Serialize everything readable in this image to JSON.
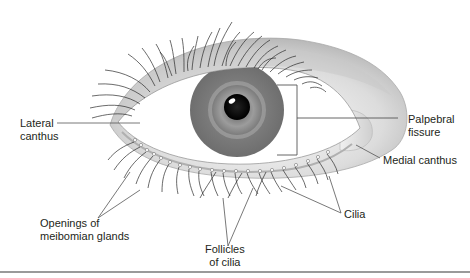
{
  "diagram": {
    "labels": {
      "lateral_canthus": [
        "Lateral",
        "canthus"
      ],
      "palpebral_fissure": [
        "Palpebral",
        "fissure"
      ],
      "medial_canthus": [
        "Medial canthus"
      ],
      "openings_meibomian": [
        "Openings of",
        "meibomian glands"
      ],
      "follicles_cilia": [
        "Follicles",
        "of cilia"
      ],
      "cilia": [
        "Cilia"
      ]
    },
    "colors": {
      "iris": "#7a7a7a",
      "iris_ring": "#9a9a9a",
      "pupil": "#111111",
      "sclera": "#ffffff",
      "lid": "#d4d4d4",
      "lines": "#555555",
      "text": "#231f20",
      "bottom_rule": "#9a9a9a"
    }
  }
}
